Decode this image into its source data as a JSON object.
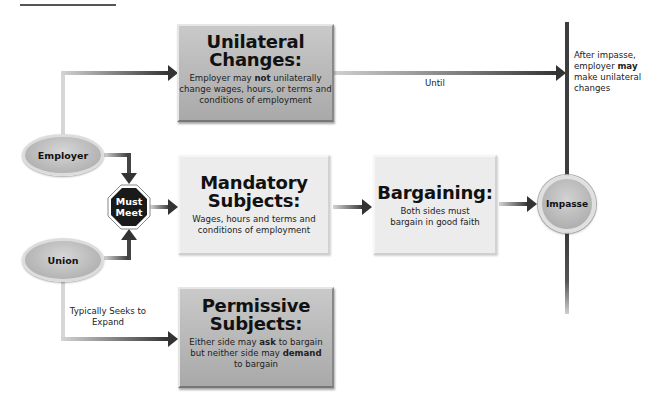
{
  "diagram": {
    "nodes": {
      "employer": {
        "label": "Employer"
      },
      "union": {
        "label": "Union"
      },
      "must_meet": {
        "line1": "Must",
        "line2": "Meet"
      },
      "impasse": {
        "label": "Impasse"
      }
    },
    "boxes": {
      "unilateral": {
        "title_line1": "Unilateral",
        "title_line2": "Changes:",
        "body_pre": "Employer may ",
        "body_bold": "not",
        "body_post": " unilaterally change wages, hours, or terms and conditions of employment"
      },
      "mandatory": {
        "title_line1": "Mandatory",
        "title_line2": "Subjects:",
        "body": "Wages, hours and terms and conditions of employment"
      },
      "bargaining": {
        "title": "Bargaining:",
        "body": "Both sides must bargain in good faith"
      },
      "permissive": {
        "title_line1": "Permissive",
        "title_line2": "Subjects:",
        "body_1": "Either side may ",
        "body_bold_1": "ask",
        "body_2": " to bargain but neither side may ",
        "body_bold_2": "demand",
        "body_3": " to bargain"
      }
    },
    "edge_labels": {
      "until": "Until",
      "typically_seeks": "Typically Seeks to Expand",
      "after_impasse_pre": "After impasse, employer ",
      "after_impasse_bold": "may",
      "after_impasse_post": " make unilateral changes"
    },
    "colors": {
      "arrow_dark": "#3a3a3a",
      "arrow_light": "#d0d0d0",
      "octagon": "#1a1a1a",
      "vertical_bar": "#3d3d3d"
    }
  }
}
